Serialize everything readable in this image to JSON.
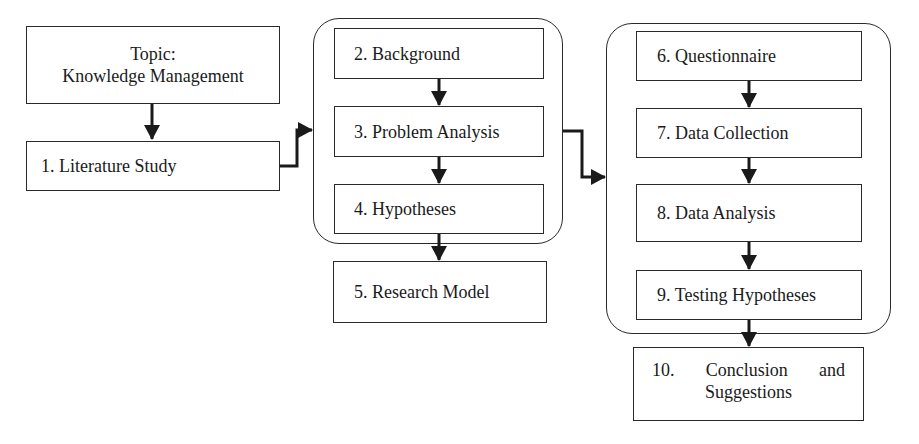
{
  "diagram": {
    "type": "research-methodology-flowchart",
    "nodes": {
      "topic": {
        "line1": "Topic:",
        "line2": "Knowledge Management"
      },
      "step1": {
        "label": "1. Literature Study"
      },
      "step2": {
        "label": "2. Background"
      },
      "step3": {
        "label": "3. Problem Analysis"
      },
      "step4": {
        "label": "4. Hypotheses"
      },
      "step5": {
        "label": "5. Research Model"
      },
      "step6": {
        "label": "6. Questionnaire"
      },
      "step7": {
        "label": "7. Data Collection"
      },
      "step8": {
        "label": "8. Data Analysis"
      },
      "step9": {
        "label": "9. Testing Hypotheses"
      },
      "step10": {
        "line1_number": "10.",
        "line1_word1": "Conclusion",
        "line1_word2": "and",
        "line2": "Suggestions"
      }
    },
    "groups": [
      {
        "id": "group-a",
        "contains": [
          "step2",
          "step3",
          "step4"
        ]
      },
      {
        "id": "group-b",
        "contains": [
          "step6",
          "step7",
          "step8",
          "step9"
        ]
      }
    ],
    "edges": [
      {
        "from": "topic",
        "to": "step1"
      },
      {
        "from": "step1",
        "to": "group-a"
      },
      {
        "from": "step2",
        "to": "step3"
      },
      {
        "from": "step3",
        "to": "step4"
      },
      {
        "from": "group-a",
        "to": "step5"
      },
      {
        "from": "group-a",
        "to": "group-b"
      },
      {
        "from": "step6",
        "to": "step7"
      },
      {
        "from": "step7",
        "to": "step8"
      },
      {
        "from": "step8",
        "to": "step9"
      },
      {
        "from": "group-b",
        "to": "step10"
      }
    ],
    "colors": {
      "stroke": "#2a2a2a",
      "background": "#ffffff",
      "text": "#1a1a1a"
    }
  }
}
